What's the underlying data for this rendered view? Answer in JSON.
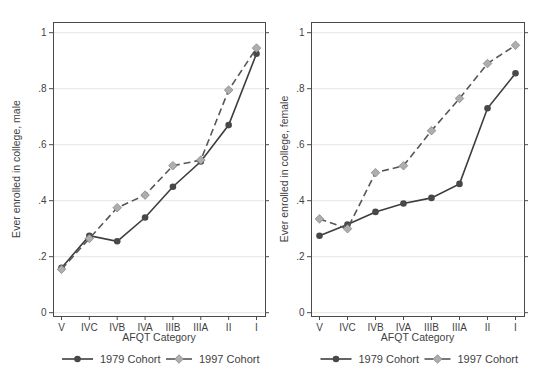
{
  "figure": {
    "background": "#ffffff",
    "text_color": "#3f3f3f",
    "grid_color": "#e5e5e5",
    "border_color": "#4a4a4a",
    "solid_line_color": "#3d3d3d",
    "solid_marker_color": "#484848",
    "dashed_line_color": "#565656",
    "dashed_marker_color": "#adb0a9",
    "dashed_marker_edge": "#7d7d7d"
  },
  "chart_data": [
    {
      "type": "line",
      "panel": "male",
      "xlabel": "AFQT Category",
      "ylabel": "Ever enrolled in college, male",
      "categories": [
        "V",
        "IVC",
        "IVB",
        "IVA",
        "IIIB",
        "IIIA",
        "II",
        "I"
      ],
      "ylim": [
        0,
        1
      ],
      "yticks": [
        0,
        0.2,
        0.4,
        0.6,
        0.8,
        1
      ],
      "ytick_labels": [
        "0",
        ".2",
        ".4",
        ".6",
        ".8",
        "1"
      ],
      "grid": true,
      "legend_position": "bottom",
      "series": [
        {
          "name": "1979 Cohort",
          "line_style": "solid",
          "marker": "circle",
          "values": [
            0.16,
            0.275,
            0.255,
            0.34,
            0.45,
            0.54,
            0.67,
            0.925
          ]
        },
        {
          "name": "1997 Cohort",
          "line_style": "dashed",
          "marker": "diamond",
          "values": [
            0.155,
            0.265,
            0.375,
            0.42,
            0.525,
            0.545,
            0.795,
            0.945
          ]
        }
      ]
    },
    {
      "type": "line",
      "panel": "female",
      "xlabel": "AFQT Category",
      "ylabel": "Ever enrolled in college, female",
      "categories": [
        "V",
        "IVC",
        "IVB",
        "IVA",
        "IIIB",
        "IIIA",
        "II",
        "I"
      ],
      "ylim": [
        0,
        1
      ],
      "yticks": [
        0,
        0.2,
        0.4,
        0.6,
        0.8,
        1
      ],
      "ytick_labels": [
        "0",
        ".2",
        ".4",
        ".6",
        ".8",
        "1"
      ],
      "grid": true,
      "legend_position": "bottom",
      "series": [
        {
          "name": "1979 Cohort",
          "line_style": "solid",
          "marker": "circle",
          "values": [
            0.275,
            0.315,
            0.36,
            0.39,
            0.41,
            0.46,
            0.73,
            0.855
          ]
        },
        {
          "name": "1997 Cohort",
          "line_style": "dashed",
          "marker": "diamond",
          "values": [
            0.335,
            0.3,
            0.5,
            0.525,
            0.65,
            0.765,
            0.89,
            0.955
          ]
        }
      ]
    }
  ]
}
